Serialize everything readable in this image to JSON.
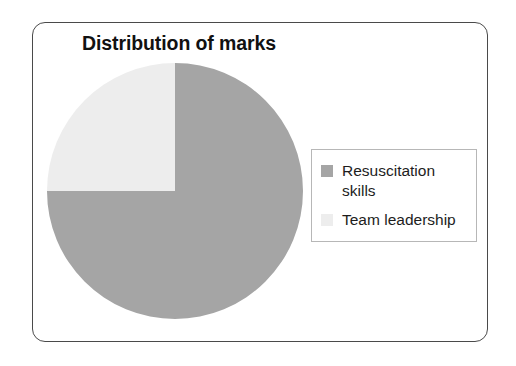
{
  "chart_data": {
    "type": "pie",
    "title": "Distribution of marks",
    "categories": [
      "Resuscitation skills",
      "Team leadership"
    ],
    "values": [
      75,
      25
    ],
    "units": "percent",
    "colors": [
      "#a5a5a5",
      "#ededed"
    ],
    "legend_position": "right",
    "start_angle_deg": 0,
    "direction": "clockwise",
    "data_labels_shown": false,
    "grid": false,
    "xlabel": "",
    "ylabel": ""
  },
  "frame": {
    "border_color": "#4a4a4a",
    "background": "#ffffff"
  },
  "title": {
    "text": "Distribution of marks"
  },
  "legend": {
    "border_color": "#b7b7b7",
    "items": [
      {
        "label": "Resuscitation skills",
        "color": "#a5a5a5"
      },
      {
        "label": "Team leadership",
        "color": "#ededed"
      }
    ]
  }
}
